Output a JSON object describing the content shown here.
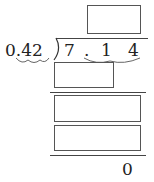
{
  "problem": {
    "divisor": "0.42",
    "divisor_int": "0",
    "divisor_dot": ".",
    "divisor_frac": "42",
    "dividend_digits": [
      "7",
      ".",
      "1",
      "4"
    ],
    "remainder": "0",
    "answer_boxes": [
      {
        "id": "quotient",
        "value": ""
      },
      {
        "id": "product-1",
        "value": ""
      },
      {
        "id": "difference-1",
        "value": ""
      },
      {
        "id": "product-2",
        "value": ""
      }
    ]
  },
  "colors": {
    "ink": "#222222",
    "box_border": "#555555",
    "brace": "#666666"
  }
}
